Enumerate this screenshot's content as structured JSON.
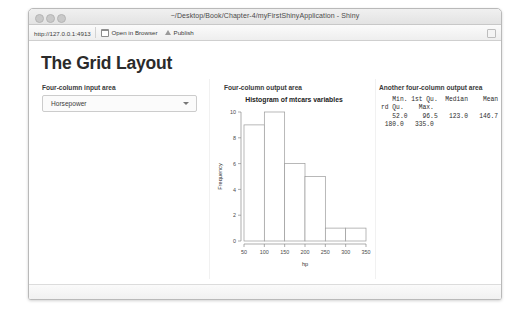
{
  "window": {
    "title": "~/Desktop/Book/Chapter-4/myFirstShinyApplication - Shiny",
    "traffic_lights": [
      "close",
      "minimize",
      "maximize"
    ]
  },
  "toolbar": {
    "url": "http://127.0.0.1:4913",
    "open_in_browser_label": "Open in Browser",
    "publish_label": "Publish",
    "open_in_browser_icon": "window-icon",
    "publish_icon": "publish-arrow-icon",
    "right_icon": "panel-icon"
  },
  "page": {
    "title": "The Grid Layout",
    "columns": {
      "input_area_label": "Four-column input area",
      "output_area_label": "Four-column output area",
      "another_output_area_label": "Another four-column output area"
    },
    "select": {
      "value": "Horsepower",
      "caret_icon": "chevron-down-icon",
      "options": [
        "Horsepower"
      ]
    },
    "summary": {
      "lines": [
        "   Min. 1st Qu.  Median    Mean 3",
        "rd Qu.    Max. ",
        "   52.0    96.5   123.0   146.7 ",
        " 180.0   335.0 "
      ],
      "stats": {
        "Min.": 52.0,
        "1st Qu.": 96.5,
        "Median": 123.0,
        "Mean": 146.7,
        "3rd Qu.": 180.0,
        "Max.": 335.0
      }
    }
  },
  "chart_data": {
    "type": "bar",
    "title": "Histogram of mtcars variables",
    "xlabel": "hp",
    "ylabel": "Frequency",
    "categories": [
      "50-100",
      "100-150",
      "150-200",
      "200-250",
      "250-300",
      "300-350"
    ],
    "bin_edges": [
      50,
      100,
      150,
      200,
      250,
      300,
      350
    ],
    "values": [
      9,
      10,
      6,
      5,
      1,
      1
    ],
    "xticks": [
      50,
      100,
      150,
      200,
      250,
      300,
      350
    ],
    "yticks": [
      0,
      2,
      4,
      6,
      8,
      10
    ],
    "xlim": [
      50,
      350
    ],
    "ylim": [
      0,
      10
    ],
    "grid": false,
    "legend": "none",
    "bar_fill": "#ffffff",
    "bar_stroke": "#9a9a9a"
  },
  "colors": {
    "window_border": "#b9b9b9",
    "titlebar_bg": "#e8e8e8",
    "page_bg": "#ffffff",
    "text": "#2b2b2b",
    "muted_text": "#3a3a3a"
  }
}
